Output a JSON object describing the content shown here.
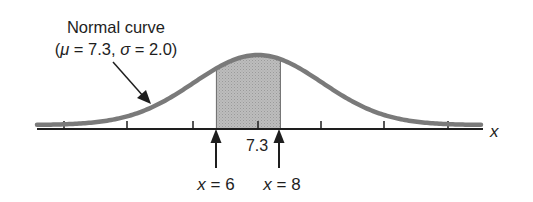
{
  "title": {
    "line1": "Normal curve",
    "line2_open": "(",
    "mu_symbol": "μ",
    "mu_eq": " = 7.3, ",
    "sigma_symbol": "σ",
    "sigma_eq": " = 2.0)"
  },
  "axis": {
    "variable": "x",
    "mean_label": "7.3"
  },
  "markers": [
    {
      "var": "x",
      "eq": " = 6"
    },
    {
      "var": "x",
      "eq": " = 8"
    }
  ],
  "colors": {
    "curve": "#7a7a7a",
    "shade": "#b9b9b9",
    "axis": "#1e1e1e"
  },
  "chart_data": {
    "type": "area",
    "title": "Normal curve (μ = 7.3, σ = 2.0)",
    "distribution": "normal",
    "mean": 7.3,
    "sd": 2.0,
    "xlabel": "x",
    "tick_labels": [
      "7.3"
    ],
    "ticks_at_sd_multiples": [
      -3,
      -2,
      -1,
      0,
      1,
      2,
      3
    ],
    "shaded_region": {
      "from": 6,
      "to": 8
    },
    "annotations": [
      "x = 6",
      "x = 8",
      "Normal curve (μ = 7.3, σ = 2.0)"
    ]
  }
}
